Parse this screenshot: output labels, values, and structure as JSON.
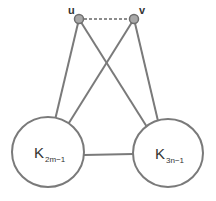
{
  "diagram": {
    "type": "graph",
    "vertices": [
      {
        "id": "u",
        "label": "u",
        "x": 79,
        "y": 19
      },
      {
        "id": "v",
        "label": "v",
        "x": 134,
        "y": 19
      }
    ],
    "cliques": [
      {
        "id": "left",
        "label": "K",
        "subscript": "2m−1",
        "cx": 48,
        "cy": 152,
        "rx": 36,
        "ry": 35
      },
      {
        "id": "right",
        "label": "K",
        "subscript": "3n−1",
        "cx": 168,
        "cy": 153,
        "rx": 35,
        "ry": 34
      }
    ],
    "edges": [
      {
        "from": "u",
        "to": "v",
        "style": "dashed"
      },
      {
        "from": "u",
        "to": "left",
        "style": "solid"
      },
      {
        "from": "u",
        "to": "right",
        "style": "solid"
      },
      {
        "from": "v",
        "to": "left",
        "style": "solid"
      },
      {
        "from": "v",
        "to": "right",
        "style": "solid"
      },
      {
        "from": "left",
        "to": "right",
        "style": "solid"
      }
    ],
    "colors": {
      "edge": "#7a7a7a",
      "vertex_fill": "#a9a9a9",
      "text": "#333333"
    }
  }
}
